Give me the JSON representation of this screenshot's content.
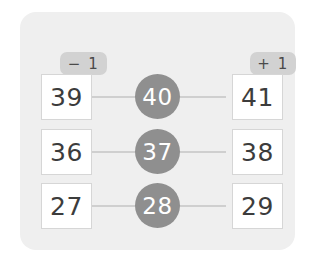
{
  "card": {
    "background_color": "#efefef",
    "headers": [
      {
        "id": "minus-one",
        "label": "− 1"
      },
      {
        "id": "plus-one",
        "label": "+ 1"
      }
    ],
    "rows": [
      {
        "left": "39",
        "center": "40",
        "right": "41"
      },
      {
        "left": "36",
        "center": "37",
        "right": "38"
      },
      {
        "left": "27",
        "center": "28",
        "right": "29"
      }
    ]
  },
  "colors": {
    "page_background": "#ffffff",
    "card_background": "#efefef",
    "badge_background": "#d2d2d2",
    "circle_fill": "#8f8f8f",
    "circle_text": "#ffffff",
    "box_background": "#ffffff",
    "box_border": "#d6d6d6",
    "box_text": "#3c3c3c",
    "connector_line": "#cfcfcf"
  }
}
